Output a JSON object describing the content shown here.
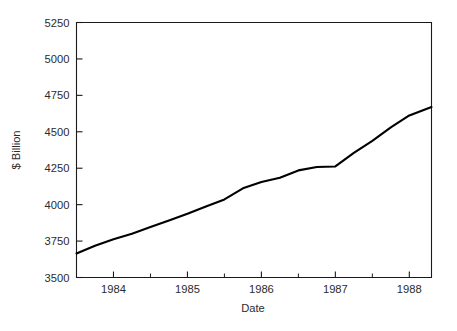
{
  "chart_data": {
    "type": "line",
    "title": "",
    "xlabel": "Date",
    "ylabel": "$ Billion",
    "xlim": [
      1983.5,
      1988.3
    ],
    "ylim": [
      3500,
      5250
    ],
    "grid": false,
    "legend": null,
    "y_ticks": [
      3500,
      3750,
      4000,
      4250,
      4500,
      4750,
      5000,
      5250
    ],
    "y_tick_labels": [
      "3500",
      "3750",
      "4000",
      "4250",
      "4500",
      "4750",
      "5000",
      "5250"
    ],
    "x_ticks": [
      1984,
      1985,
      1986,
      1987,
      1988
    ],
    "x_tick_labels": [
      "1984",
      "1985",
      "1986",
      "1987",
      "1988"
    ],
    "x_minor_ticks": [
      1984.5,
      1985.5,
      1986.5,
      1987.5
    ],
    "series": [
      {
        "name": "",
        "color": "#000000",
        "x": [
          1983.5,
          1983.75,
          1984.0,
          1984.25,
          1984.5,
          1984.75,
          1985.0,
          1985.25,
          1985.5,
          1985.75,
          1986.0,
          1986.25,
          1986.5,
          1986.75,
          1987.0,
          1987.25,
          1987.5,
          1987.75,
          1988.0,
          1988.3
        ],
        "y": [
          3665,
          3716,
          3760,
          3800,
          3845,
          3890,
          3935,
          3985,
          4035,
          4110,
          4155,
          4180,
          4230,
          4255,
          4260,
          4350,
          4430,
          4520,
          4600,
          4660
        ],
        "y_full": [
          3665,
          3716,
          3760,
          3800,
          3845,
          3890,
          3935,
          3985,
          4035,
          4110,
          4155,
          4180,
          4230,
          4255,
          4260,
          4350,
          4430,
          4520,
          4600,
          4660
        ]
      }
    ],
    "points": [
      {
        "x": 1983.5,
        "y": 3665
      },
      {
        "x": 1983.75,
        "y": 3718
      },
      {
        "x": 1984.0,
        "y": 3762
      },
      {
        "x": 1984.25,
        "y": 3800
      },
      {
        "x": 1984.5,
        "y": 3846
      },
      {
        "x": 1984.75,
        "y": 3891
      },
      {
        "x": 1985.0,
        "y": 3937
      },
      {
        "x": 1985.25,
        "y": 3987
      },
      {
        "x": 1985.5,
        "y": 4036
      },
      {
        "x": 1985.75,
        "y": 4112
      },
      {
        "x": 1986.0,
        "y": 4156
      },
      {
        "x": 1986.25,
        "y": 4185
      },
      {
        "x": 1986.5,
        "y": 4235
      },
      {
        "x": 1986.75,
        "y": 4258
      },
      {
        "x": 1987.0,
        "y": 4262
      },
      {
        "x": 1987.25,
        "y": 4355
      },
      {
        "x": 1987.5,
        "y": 4438
      },
      {
        "x": 1987.75,
        "y": 4530
      },
      {
        "x": 1988.0,
        "y": 4612
      },
      {
        "x": 1988.3,
        "y": 4670
      }
    ]
  },
  "figure": {
    "background_color": "#ffffff",
    "axis_color": "#1a1a1a",
    "line_color": "#000000"
  }
}
